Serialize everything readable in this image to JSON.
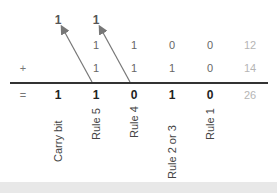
{
  "carry_row": [
    "1",
    "1"
  ],
  "row1": {
    "bits": [
      "1",
      "1",
      "0",
      "0"
    ],
    "decimal": "12"
  },
  "row2": {
    "operator": "+",
    "bits": [
      "1",
      "1",
      "1",
      "0"
    ],
    "decimal": "14"
  },
  "result": {
    "operator": "=",
    "bits": [
      "1",
      "1",
      "0",
      "1",
      "0"
    ],
    "decimal": "26"
  },
  "labels": [
    "Carry bit",
    "Rule 5",
    "Rule 4",
    "Rule 2 or 3",
    "Rule 1"
  ],
  "colors": {
    "result": "#222222",
    "operand": "#666666",
    "decimal": "#b5b5b5",
    "arrow": "#777777"
  }
}
